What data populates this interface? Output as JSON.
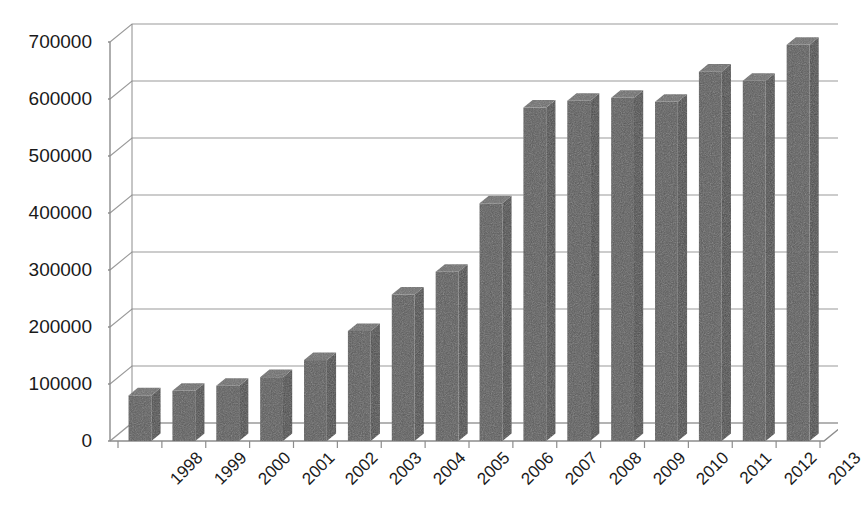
{
  "chart_data": {
    "type": "bar",
    "title": "",
    "subtitle": "",
    "xlabel": "",
    "ylabel": "",
    "categories": [
      "1998",
      "1999",
      "2000",
      "2001",
      "2002",
      "2003",
      "2004",
      "2005",
      "2006",
      "2007",
      "2008",
      "2009",
      "2010",
      "2011",
      "2012",
      "2013"
    ],
    "values": [
      80000,
      88000,
      97000,
      112000,
      142000,
      193000,
      257000,
      297000,
      417000,
      585000,
      597000,
      602000,
      595000,
      648000,
      632000,
      695000
    ],
    "ylim": [
      0,
      700000
    ],
    "ytick_labels": [
      "0",
      "100000",
      "200000",
      "300000",
      "400000",
      "500000",
      "600000",
      "700000"
    ],
    "ytick_values": [
      0,
      100000,
      200000,
      300000,
      400000,
      500000,
      600000,
      700000
    ],
    "grid": true,
    "legend": "none",
    "style": "3d-column",
    "bar_color": "#5a5a5a",
    "bar_side_color": "#4a4a4a",
    "bar_top_color": "#6e6e6e",
    "grid_color": "#9a9a9a",
    "axis_color": "#8c8c8c",
    "text_color": "#1a1a1a",
    "background": "#ffffff"
  }
}
